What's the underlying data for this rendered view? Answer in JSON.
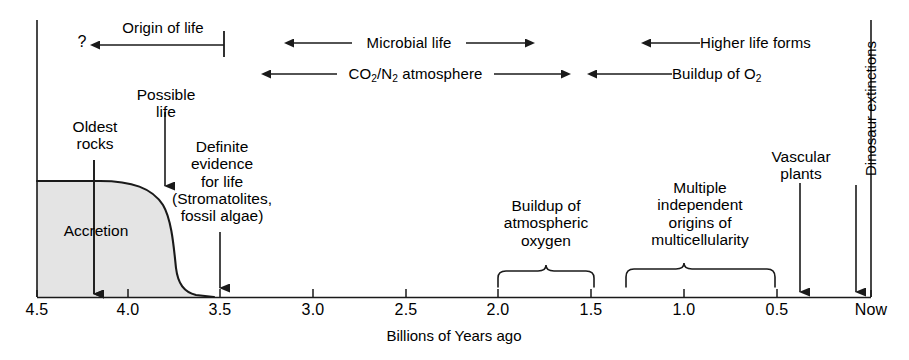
{
  "figure": {
    "axis_title": "Billions of Years ago",
    "axis_ticks": [
      "4.5",
      "4.0",
      "3.5",
      "3.0",
      "2.5",
      "2.0",
      "1.5",
      "1.0",
      "0.5",
      "Now"
    ],
    "axis_values": [
      4.5,
      4.0,
      3.5,
      3.0,
      2.5,
      2.0,
      1.5,
      1.0,
      0.5,
      0.0
    ]
  },
  "bands": {
    "uncertainty_marker": "?",
    "origin_of_life": "Origin of life",
    "microbial_life": "Microbial life",
    "higher_life_forms": "Higher life forms",
    "co2_n2_atmosphere_pre": "CO",
    "co2_n2_atmosphere_sub1": "2",
    "co2_n2_atmosphere_mid": "/N",
    "co2_n2_atmosphere_sub2": "2",
    "co2_n2_atmosphere_post": " atmosphere",
    "buildup_of_o2_pre": "Buildup of O",
    "buildup_of_o2_sub": "2"
  },
  "events": {
    "oldest_rocks": "Oldest\nrocks",
    "possible_life": "Possible\nlife",
    "definite_evidence": "Definite\nevidence\nfor life\n(Stromatolites,\nfossil algae)",
    "accretion": "Accretion",
    "buildup_atmospheric_oxygen": "Buildup of\natmospheric\noxygen",
    "multicellularity": "Multiple\nindependent\norigins of\nmulticellularity",
    "vascular_plants": "Vascular\nplants",
    "dinosaur_extinctions": "Dinosaur extinctions"
  },
  "chart_data": {
    "type": "line",
    "xlabel": "Billions of Years ago",
    "ylabel": "",
    "xlim": [
      4.5,
      0.0
    ],
    "grid": false,
    "legend": "none",
    "tick_labels": [
      "4.5",
      "4.0",
      "3.5",
      "3.0",
      "2.5",
      "2.0",
      "1.5",
      "1.0",
      "0.5",
      "Now"
    ],
    "tick_values": [
      4.5,
      4.0,
      3.5,
      3.0,
      2.5,
      2.0,
      1.5,
      1.0,
      0.5,
      0.0
    ],
    "series": [
      {
        "name": "Accretion (shaded region boundary)",
        "type": "area",
        "x": [
          4.5,
          4.15,
          3.95,
          3.82,
          3.76,
          3.7,
          3.6,
          3.5
        ],
        "y": [
          1.0,
          1.0,
          0.95,
          0.8,
          0.5,
          0.18,
          0.05,
          0.0
        ]
      }
    ],
    "annotations": [
      {
        "label": "Origin of life",
        "type": "range-arrow-left",
        "x_start": 4.5,
        "x_end": 3.48,
        "row": 1
      },
      {
        "label": "?",
        "type": "uncertainty",
        "x": 4.55,
        "row": 1
      },
      {
        "label": "Microbial life",
        "type": "range-arrow-both",
        "x_start": 3.12,
        "x_end": 1.88,
        "row": 1
      },
      {
        "label": "Higher life forms",
        "type": "range-arrow-left",
        "x_start": 1.18,
        "x_end": 0.0,
        "row": 1
      },
      {
        "label": "CO2/N2 atmosphere",
        "type": "range-arrow-both",
        "x_start": 3.25,
        "x_end": 1.7,
        "row": 2
      },
      {
        "label": "Buildup of O2",
        "type": "range-arrow-left",
        "x_start": 1.54,
        "x_end": 0.08,
        "row": 2
      },
      {
        "label": "Oldest rocks",
        "type": "pointer",
        "x": 4.18
      },
      {
        "label": "Possible life",
        "type": "pointer",
        "x": 3.8
      },
      {
        "label": "Definite evidence for life (Stromatolites, fossil algae)",
        "type": "pointer",
        "x": 3.5
      },
      {
        "label": "Accretion",
        "type": "region-label",
        "x_start": 4.5,
        "x_end": 3.55
      },
      {
        "label": "Buildup of atmospheric oxygen",
        "type": "brace",
        "x_start": 2.0,
        "x_end": 1.5
      },
      {
        "label": "Multiple independent origins of multicellularity",
        "type": "brace",
        "x_start": 1.3,
        "x_end": 0.5
      },
      {
        "label": "Vascular plants",
        "type": "pointer",
        "x": 0.42
      },
      {
        "label": "Dinosaur extinctions",
        "type": "pointer-vertical",
        "x": 0.08
      }
    ]
  }
}
